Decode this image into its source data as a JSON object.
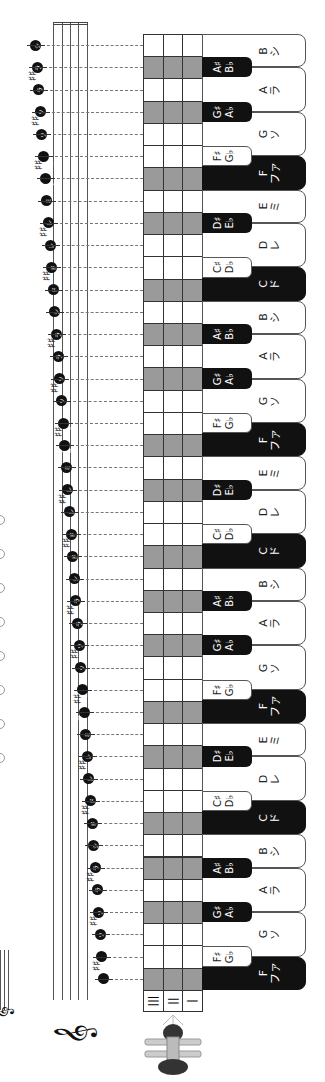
{
  "orientation": "rotated-90-clockwise",
  "colors": {
    "white_key": "#ffffff",
    "black_key": "#111111",
    "grid_shade": "#9a9a9a",
    "note_head": "#111111"
  },
  "tine_header": [
    "|||",
    "||",
    "|"
  ],
  "instrument_icon": "kalimba-icon",
  "clef": "treble-clef",
  "rows": [
    {
      "note": "B",
      "jp": "シ",
      "type": "white",
      "shade": false
    },
    {
      "note": "A♯",
      "alt": "B♭",
      "type": "black",
      "shade": true
    },
    {
      "note": "A",
      "jp": "ラ",
      "type": "white",
      "shade": false
    },
    {
      "note": "G♯",
      "alt": "A♭",
      "type": "black",
      "shade": true
    },
    {
      "note": "G",
      "jp": "ソ",
      "type": "white",
      "shade": false
    },
    {
      "note": "F♯",
      "alt": "G♭",
      "type": "black-light",
      "shade": false
    },
    {
      "note": "F",
      "jp": "ファ",
      "type": "white-dark",
      "shade": true
    },
    {
      "note": "E",
      "jp": "ミ",
      "type": "white",
      "shade": false
    },
    {
      "note": "D♯",
      "alt": "E♭",
      "type": "black",
      "shade": true
    },
    {
      "note": "D",
      "jp": "レ",
      "type": "white",
      "shade": false
    },
    {
      "note": "C♯",
      "alt": "D♭",
      "type": "black-light",
      "shade": false
    },
    {
      "note": "C",
      "jp": "ド",
      "type": "white-dark",
      "shade": true
    },
    {
      "note": "B",
      "jp": "シ",
      "type": "white",
      "shade": false
    },
    {
      "note": "A♯",
      "alt": "B♭",
      "type": "black",
      "shade": true
    },
    {
      "note": "A",
      "jp": "ラ",
      "type": "white",
      "shade": false
    },
    {
      "note": "G♯",
      "alt": "A♭",
      "type": "black",
      "shade": true
    },
    {
      "note": "G",
      "jp": "ソ",
      "type": "white",
      "shade": false
    },
    {
      "note": "F♯",
      "alt": "G♭",
      "type": "black-light",
      "shade": false
    },
    {
      "note": "F",
      "jp": "ファ",
      "type": "white-dark",
      "shade": true
    },
    {
      "note": "E",
      "jp": "ミ",
      "type": "white",
      "shade": false
    },
    {
      "note": "D♯",
      "alt": "E♭",
      "type": "black",
      "shade": true
    },
    {
      "note": "D",
      "jp": "レ",
      "type": "white",
      "shade": false
    },
    {
      "note": "C♯",
      "alt": "D♭",
      "type": "black-light",
      "shade": false
    },
    {
      "note": "C",
      "jp": "ド",
      "type": "white-dark",
      "shade": true
    },
    {
      "note": "B",
      "jp": "シ",
      "type": "white",
      "shade": false
    },
    {
      "note": "A♯",
      "alt": "B♭",
      "type": "black",
      "shade": true
    },
    {
      "note": "A",
      "jp": "ラ",
      "type": "white",
      "shade": false
    },
    {
      "note": "G♯",
      "alt": "A♭",
      "type": "black",
      "shade": true
    },
    {
      "note": "G",
      "jp": "ソ",
      "type": "white",
      "shade": false
    },
    {
      "note": "F♯",
      "alt": "G♭",
      "type": "black-light",
      "shade": false
    },
    {
      "note": "F",
      "jp": "ファ",
      "type": "white-dark",
      "shade": true
    },
    {
      "note": "E",
      "jp": "ミ",
      "type": "white",
      "shade": false
    },
    {
      "note": "D♯",
      "alt": "E♭",
      "type": "black",
      "shade": true
    },
    {
      "note": "D",
      "jp": "レ",
      "type": "white",
      "shade": false
    },
    {
      "note": "C♯",
      "alt": "D♭",
      "type": "black-light",
      "shade": false
    },
    {
      "note": "C",
      "jp": "ド",
      "type": "white-dark",
      "shade": true
    },
    {
      "note": "B",
      "jp": "シ",
      "type": "white",
      "shade": false
    },
    {
      "note": "A♯",
      "alt": "B♭",
      "type": "black",
      "shade": true
    },
    {
      "note": "A",
      "jp": "ラ",
      "type": "white",
      "shade": false
    },
    {
      "note": "G♯",
      "alt": "A♭",
      "type": "black",
      "shade": true
    },
    {
      "note": "G",
      "jp": "ソ",
      "type": "white",
      "shade": false
    },
    {
      "note": "F♯",
      "alt": "G♭",
      "type": "black-light",
      "shade": false
    },
    {
      "note": "F",
      "jp": "ファ",
      "type": "white-dark",
      "shade": true
    }
  ]
}
